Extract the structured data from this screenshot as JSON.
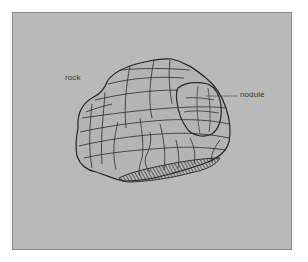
{
  "figure": {
    "labels": {
      "rock": "rock",
      "nodule": "nodule"
    },
    "colors": {
      "background": "#b9b9b9",
      "frame_border": "#8a8a8a",
      "line": "#2a2a2a",
      "hatch": "#3a3a3a",
      "text": "#3a3a3a"
    }
  }
}
